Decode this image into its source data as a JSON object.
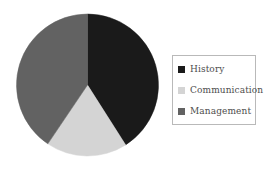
{
  "chart_data": {
    "type": "pie",
    "title": "",
    "subtitle": "",
    "xlabel": "",
    "ylabel": "",
    "grid": false,
    "legend_position": "right",
    "start_angle_deg": 0,
    "direction": "clockwise",
    "categories": [
      "History",
      "Communication",
      "Management"
    ],
    "values": [
      41,
      18.5,
      40.5
    ],
    "slices": [
      {
        "label": "History",
        "value": 41,
        "percent": "41%",
        "color": "#1a1a1a",
        "start_angle_deg": 0,
        "end_angle_deg": 147.5
      },
      {
        "label": "Communication",
        "value": 18.5,
        "percent": "18.5%",
        "color": "#d4d4d4",
        "start_angle_deg": 147.5,
        "end_angle_deg": 214
      },
      {
        "label": "Management",
        "value": 40.5,
        "percent": "40.5%",
        "color": "#626262",
        "start_angle_deg": 214,
        "end_angle_deg": 360
      }
    ]
  },
  "legend": {
    "items": [
      {
        "label": "History",
        "color": "#1a1a1a"
      },
      {
        "label": "Communication",
        "color": "#d4d4d4"
      },
      {
        "label": "Management",
        "color": "#626262"
      }
    ],
    "border_color": "#b9b9b9",
    "background_color": "#ffffff",
    "text_color": "#4d4d4d"
  },
  "canvas": {
    "background_color": "#ffffff"
  }
}
